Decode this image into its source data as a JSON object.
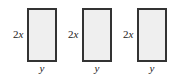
{
  "figure": {
    "rectangles": [
      {
        "height_label_coef": "2",
        "height_label_var": "x",
        "width_label": "y"
      },
      {
        "height_label_coef": "2",
        "height_label_var": "x",
        "width_label": "y"
      },
      {
        "height_label_coef": "2",
        "height_label_var": "x",
        "width_label": "y"
      }
    ],
    "colors": {
      "fill": "#efefef",
      "border": "#333333"
    }
  }
}
